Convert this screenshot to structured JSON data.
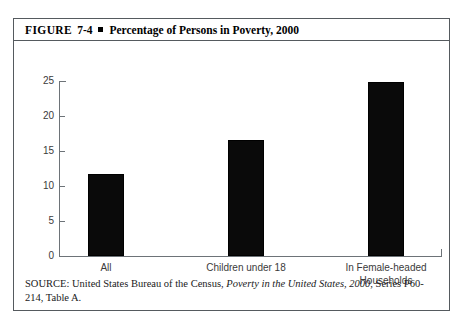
{
  "figure": {
    "label": "FIGURE",
    "number": "7-4",
    "bullet_icon": "square-bullet",
    "title": "Percentage of Persons in Poverty, 2000"
  },
  "source": {
    "prefix": "SOURCE: United States Bureau of the Census,",
    "italic_part": "Poverty in the United States, 2000",
    "suffix": ", Series P60-214, Table A."
  },
  "chart_data": {
    "type": "bar",
    "title": "Percentage of Persons in Poverty, 2000",
    "xlabel": "",
    "ylabel": "",
    "categories": [
      "All",
      "Children under 18",
      "In Female-headed Households"
    ],
    "category_lines": [
      [
        "All"
      ],
      [
        "Children under 18"
      ],
      [
        "In Female-headed",
        "Households"
      ]
    ],
    "values": [
      11.7,
      16.6,
      24.8
    ],
    "ylim": [
      0,
      25
    ],
    "yticks": [
      0,
      5,
      10,
      15,
      20,
      25
    ],
    "ytick_labels": [
      "0",
      "5",
      "10",
      "15",
      "20",
      "25"
    ],
    "grid": false,
    "legend": false,
    "bar_color": "#0a0a0a",
    "axis_color": "#6d7378"
  }
}
